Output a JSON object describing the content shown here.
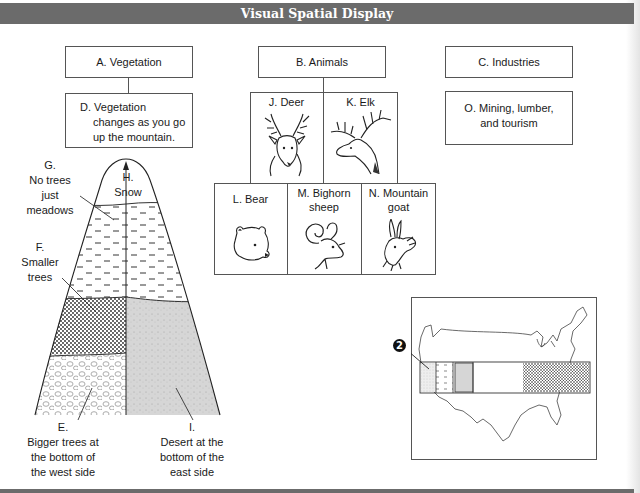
{
  "header": {
    "title": "Visual Spatial Display"
  },
  "boxes": {
    "vegetation": "A. Vegetation",
    "animals": "B. Animals",
    "industries": "C. Industries",
    "vegetation_detail": [
      "D. Vegetation",
      "changes as you go",
      "up the mountain."
    ],
    "industries_detail": [
      "O. Mining, lumber,",
      "and tourism"
    ]
  },
  "animals": {
    "row1": [
      {
        "id": "deer",
        "label": "J. Deer",
        "icon": "deer-head-icon"
      },
      {
        "id": "elk",
        "label": "K. Elk",
        "icon": "elk-head-icon"
      }
    ],
    "row2": [
      {
        "id": "bear",
        "label": "L. Bear",
        "icon": "bear-head-icon"
      },
      {
        "id": "bighorn",
        "label": [
          "M. Bighorn",
          "sheep"
        ],
        "icon": "bighorn-sheep-head-icon"
      },
      {
        "id": "goat",
        "label": [
          "N. Mountain",
          "goat"
        ],
        "icon": "mountain-goat-head-icon"
      }
    ]
  },
  "mountain": {
    "labels": {
      "G": [
        "G.",
        "No trees",
        "just",
        "meadows"
      ],
      "H": [
        "H.",
        "Snow"
      ],
      "F": [
        "F.",
        "Smaller",
        "trees"
      ],
      "E": [
        "E.",
        "Bigger trees at",
        "the bottom of",
        "the west side"
      ],
      "I": [
        "I.",
        "Desert at the",
        "bottom of the",
        "east side"
      ]
    },
    "zones": [
      "snow",
      "meadows",
      "smaller-trees",
      "bigger-trees",
      "desert"
    ]
  },
  "map": {
    "callout_number": "2",
    "description": "Map of the contiguous United States with a horizontal band highlighting regions"
  },
  "colors": {
    "header_bg": "#6b6b6b",
    "header_text": "#ffffff",
    "line": "#555555",
    "desert_fill": "#d8d8d8"
  }
}
